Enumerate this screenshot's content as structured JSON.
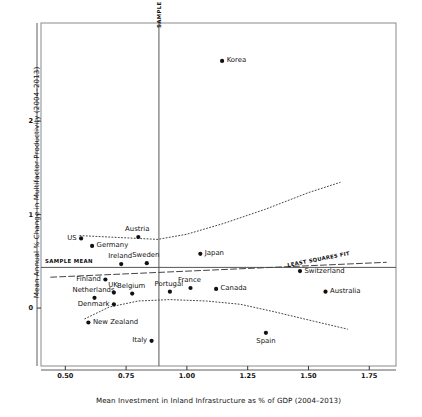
{
  "chart_data": {
    "type": "scatter",
    "title": "",
    "xlabel": "Mean Investment in Inland Infrastructure as % of GDP (2004–2013)",
    "ylabel": "Mean Annual % Change in Multifactor Productivity (2004–2013)",
    "xlim": [
      0.4,
      1.86
    ],
    "ylim": [
      -0.62,
      3.05
    ],
    "xticks": [
      "0.50",
      "0.75",
      "1.00",
      "1.25",
      "1.50",
      "1.75"
    ],
    "xtick_values": [
      0.5,
      0.75,
      1.0,
      1.25,
      1.5,
      1.75
    ],
    "yticks": [
      "0",
      "1",
      "2"
    ],
    "ytick_values": [
      0,
      1,
      2
    ],
    "grid": false,
    "legend": "none",
    "points": [
      {
        "name": "Korea",
        "x": 1.145,
        "y": 2.645,
        "label_pos": "right"
      },
      {
        "name": "Austria",
        "x": 0.8,
        "y": 0.76,
        "label_pos": "above"
      },
      {
        "name": "US",
        "x": 0.565,
        "y": 0.745,
        "label_pos": "left"
      },
      {
        "name": "Germany",
        "x": 0.61,
        "y": 0.665,
        "label_pos": "right"
      },
      {
        "name": "Ireland",
        "x": 0.73,
        "y": 0.47,
        "label_pos": "above"
      },
      {
        "name": "Sweden",
        "x": 0.835,
        "y": 0.48,
        "label_pos": "above"
      },
      {
        "name": "Finland",
        "x": 0.665,
        "y": 0.305,
        "label_pos": "left"
      },
      {
        "name": "Japan",
        "x": 1.055,
        "y": 0.58,
        "label_pos": "right"
      },
      {
        "name": "Switzerland",
        "x": 1.465,
        "y": 0.395,
        "label_pos": "right"
      },
      {
        "name": "UK",
        "x": 0.7,
        "y": 0.165,
        "label_pos": "above"
      },
      {
        "name": "Belgium",
        "x": 0.775,
        "y": 0.155,
        "label_pos": "above"
      },
      {
        "name": "Netherlands",
        "x": 0.62,
        "y": 0.11,
        "label_pos": "above"
      },
      {
        "name": "Portugal",
        "x": 0.93,
        "y": 0.175,
        "label_pos": "above"
      },
      {
        "name": "France",
        "x": 1.015,
        "y": 0.215,
        "label_pos": "above"
      },
      {
        "name": "Canada",
        "x": 1.12,
        "y": 0.205,
        "label_pos": "right"
      },
      {
        "name": "Australia",
        "x": 1.57,
        "y": 0.175,
        "label_pos": "right"
      },
      {
        "name": "Denmark",
        "x": 0.7,
        "y": 0.04,
        "label_pos": "left"
      },
      {
        "name": "New Zealand",
        "x": 0.595,
        "y": -0.155,
        "label_pos": "right"
      },
      {
        "name": "Italy",
        "x": 0.855,
        "y": -0.35,
        "label_pos": "left"
      },
      {
        "name": "Spain",
        "x": 1.325,
        "y": -0.265,
        "label_pos": "below"
      }
    ],
    "reference_lines": [
      {
        "name": "sample-mean-vertical",
        "orientation": "vertical",
        "value": 0.885,
        "label": "SAMPLE MEAN"
      },
      {
        "name": "sample-mean-horizontal",
        "orientation": "horizontal",
        "value": 0.435,
        "label": "SAMPLE MEAN"
      }
    ],
    "fit_lines": [
      {
        "name": "least-squares-fit",
        "style": "dashed",
        "label": "LEAST SQUARES FIT",
        "points": [
          [
            0.44,
            0.33
          ],
          [
            1.82,
            0.49
          ]
        ]
      },
      {
        "name": "upper-loess-curve",
        "style": "dotted",
        "label": "",
        "points": [
          [
            0.56,
            0.775
          ],
          [
            0.72,
            0.755
          ],
          [
            0.88,
            0.735
          ],
          [
            1.0,
            0.79
          ],
          [
            1.15,
            0.905
          ],
          [
            1.32,
            1.055
          ],
          [
            1.5,
            1.235
          ],
          [
            1.63,
            1.345
          ]
        ]
      },
      {
        "name": "lower-loess-curve",
        "style": "dotted",
        "label": "",
        "points": [
          [
            0.58,
            -0.115
          ],
          [
            0.68,
            0.01
          ],
          [
            0.8,
            0.075
          ],
          [
            0.93,
            0.09
          ],
          [
            1.08,
            0.075
          ],
          [
            1.22,
            0.04
          ],
          [
            1.36,
            -0.04
          ],
          [
            1.52,
            -0.14
          ],
          [
            1.66,
            -0.225
          ]
        ]
      }
    ]
  }
}
